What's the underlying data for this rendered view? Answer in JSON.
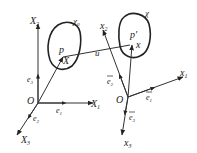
{
  "diagram": {
    "type": "continuum-mechanics-configurations",
    "colors": {
      "stroke": "#222222",
      "background": "#ffffff"
    },
    "reference_frame": {
      "origin": "O",
      "axes": [
        "X1",
        "X2",
        "X3"
      ],
      "basis": [
        "e1",
        "e2",
        "e3"
      ]
    },
    "current_frame": {
      "origin": "O",
      "axes": [
        "x1",
        "x2",
        "x3"
      ],
      "basis": [
        "ē1",
        "ē2",
        "ē3"
      ]
    },
    "reference_body": {
      "label": "χ0",
      "point": "p",
      "position": "X"
    },
    "current_body": {
      "label": "χ",
      "point": "p′",
      "position": "x"
    },
    "displacement": "u"
  },
  "labels": {
    "X2": "X",
    "X2_sub": "2",
    "X1": "X",
    "X1_sub": "1",
    "X3": "X",
    "X3_sub": "3",
    "O_left": "O",
    "e1": "e",
    "e1_sub": "1",
    "e2": "e",
    "e2_sub": "2",
    "e3": "e",
    "e3_sub": "3",
    "chi0": "χ",
    "chi0_sub": "0",
    "p": "p",
    "X": "X",
    "u": "u",
    "chi": "χ",
    "p_prime": "p′",
    "x": "x",
    "x2": "x",
    "x2_sub": "2",
    "x1": "x",
    "x1_sub": "1",
    "x3": "x",
    "x3_sub": "3",
    "O_right": "O",
    "ebar1": "e",
    "ebar1_sub": "1",
    "ebar2": "e",
    "ebar2_sub": "2",
    "ebar3": "e",
    "ebar3_sub": "3"
  }
}
